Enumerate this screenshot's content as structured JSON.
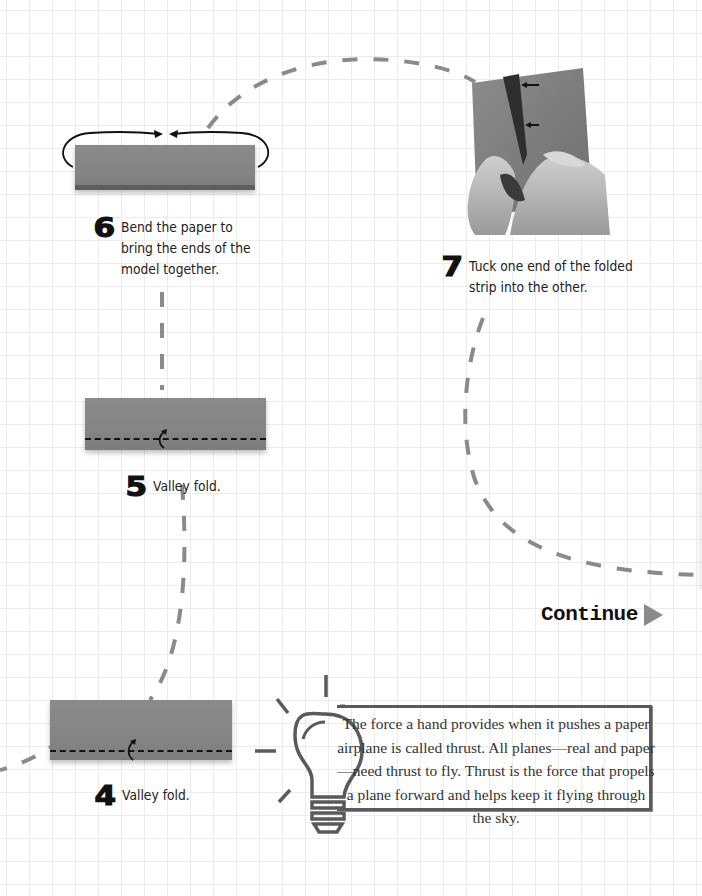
{
  "steps": [
    {
      "number": "4",
      "text": "Valley fold."
    },
    {
      "number": "5",
      "text": "Valley fold."
    },
    {
      "number": "6",
      "text": "Bend the paper to\nbring the ends of the\nmodel together."
    },
    {
      "number": "7",
      "text": "Tuck one end of the folded\nstrip into the other."
    }
  ],
  "continue": {
    "label": "Continue",
    "icon": "play-triangle-icon"
  },
  "fact_box": {
    "icon": "lightbulb-icon",
    "text": "The force a hand provides when it pushes a paper airplane is called thrust. All planes—real and paper—need thrust to fly. Thrust is the force that propels a plane forward and helps keep it flying through the sky."
  },
  "colors": {
    "paper": "#858585",
    "dashed_path": "#8a8a8a",
    "bulb": "#5a5a5a",
    "grid": "#ececec"
  }
}
